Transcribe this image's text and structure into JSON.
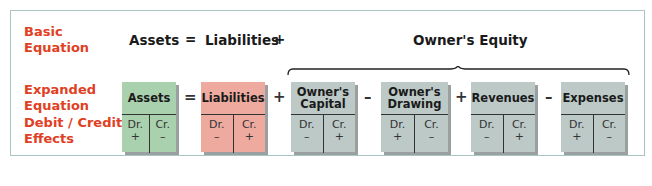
{
  "labels": {
    "basic_line1": "Basic",
    "basic_line2": "Equation",
    "expanded_line1": "Expanded",
    "expanded_line2": "Equation",
    "effects_line1": "Debit / Credit",
    "effects_line2": "Effects"
  },
  "basic_equation": {
    "assets": "Assets",
    "equals": "=",
    "liabilities": "Liabilities",
    "plus": "+",
    "equity": "Owner's Equity"
  },
  "accounts": [
    {
      "name_line1": "Assets",
      "name_line2": "",
      "dr": "Dr.",
      "dr_sign": "+",
      "cr": "Cr.",
      "cr_sign": "–",
      "color": "#a9d1ae"
    },
    {
      "name_line1": "Liabilities",
      "name_line2": "",
      "dr": "Dr.",
      "dr_sign": "–",
      "cr": "Cr.",
      "cr_sign": "+",
      "color": "#efaaa0"
    },
    {
      "name_line1": "Owner's",
      "name_line2": "Capital",
      "dr": "Dr.",
      "dr_sign": "–",
      "cr": "Cr.",
      "cr_sign": "+",
      "color": "#bcc9c7"
    },
    {
      "name_line1": "Owner's",
      "name_line2": "Drawing",
      "dr": "Dr.",
      "dr_sign": "+",
      "cr": "Cr.",
      "cr_sign": "–",
      "color": "#bcc9c7"
    },
    {
      "name_line1": "Revenues",
      "name_line2": "",
      "dr": "Dr.",
      "dr_sign": "–",
      "cr": "Cr.",
      "cr_sign": "+",
      "color": "#bcc9c7"
    },
    {
      "name_line1": "Expenses",
      "name_line2": "",
      "dr": "Dr.",
      "dr_sign": "+",
      "cr": "Cr.",
      "cr_sign": "–",
      "color": "#bcc9c7"
    }
  ],
  "operators": [
    "=",
    "+",
    "–",
    "+",
    "–"
  ],
  "colors": {
    "label_red": "#e0401f",
    "frame": "#a9c6c4",
    "assets_green": "#a9d1ae",
    "liabilities_red": "#efaaa0",
    "equity_grey": "#bcc9c7"
  }
}
